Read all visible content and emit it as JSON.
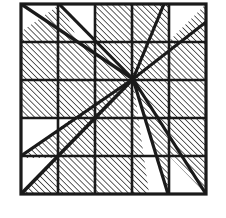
{
  "figure": {
    "type": "geometric-diagram",
    "canvas": {
      "width": 226,
      "height": 218,
      "background": "#ffffff"
    },
    "colors": {
      "ink": "#1a1a1a",
      "hatch": "#2b2b2b",
      "fill_white": "#ffffff",
      "paper": "#ffffff"
    },
    "square": {
      "x": 21,
      "y": 4,
      "width": 185,
      "height": 190,
      "border_width": 3.2,
      "label": "outer-square"
    },
    "grid": {
      "rows": 5,
      "cols": 5,
      "line_width": 2.6,
      "x_lines": [
        58,
        95,
        132,
        169
      ],
      "y_lines": [
        42,
        80,
        118,
        156
      ],
      "label": "5x5-grid"
    },
    "hatching": {
      "angle_degrees": 45,
      "direction": "bottom-left-to-top-right",
      "spacing": 4.2,
      "stroke_width": 1.5,
      "label": "diagonal-hatch-fill"
    },
    "center_point": {
      "x": 133,
      "y": 79,
      "label": "convergence-point"
    },
    "rays": [
      {
        "name": "ray-up-right-to-top-edge",
        "x1": 133,
        "y1": 79,
        "x2": 164,
        "y2": 4,
        "width": 3.2
      },
      {
        "name": "ray-up-left-to-top-left-corner",
        "x1": 133,
        "y1": 79,
        "x2": 22,
        "y2": 5,
        "width": 3.4
      },
      {
        "name": "ray-up-left-secondary",
        "x1": 133,
        "y1": 79,
        "x2": 58,
        "y2": 5,
        "width": 3.2
      },
      {
        "name": "ray-down-left-main-diagonal",
        "x1": 133,
        "y1": 79,
        "x2": 22,
        "y2": 193,
        "width": 3.6
      },
      {
        "name": "ray-down-left-secondary",
        "x1": 133,
        "y1": 79,
        "x2": 22,
        "y2": 156,
        "width": 3.2
      },
      {
        "name": "ray-down-right-steep",
        "x1": 133,
        "y1": 79,
        "x2": 168,
        "y2": 193,
        "width": 3.2
      },
      {
        "name": "ray-down-right-shallow",
        "x1": 133,
        "y1": 79,
        "x2": 205,
        "y2": 193,
        "width": 3.2
      },
      {
        "name": "ray-up-right-to-corner",
        "x1": 133,
        "y1": 79,
        "x2": 205,
        "y2": 23,
        "width": 3.0
      }
    ],
    "white_regions": [
      {
        "name": "white-wedge-top-left",
        "points": "22,5 58,5 22,30",
        "note": "triangle at top-left corner above diagonal"
      },
      {
        "name": "white-wedge-top-second",
        "points": "60,5 95,5 95,42 80,42",
        "note": "wedge between two upper-left rays"
      },
      {
        "name": "white-triangle-top-right",
        "points": "169,5 205,5 205,41 169,41",
        "note": "top-right cell triangle above corner ray"
      },
      {
        "name": "white-triangle-mid-left",
        "points": "22,120 70,120 22,156",
        "note": "triangle left of lower diagonal"
      },
      {
        "name": "white-triangle-bottom-left",
        "points": "22,158 22,193 57,158",
        "note": "bottom-left corner triangle"
      },
      {
        "name": "white-wedge-bottom-right-inner",
        "points": "133,79 168,193 150,193",
        "note": "narrow wedge between two descending rays"
      },
      {
        "name": "white-triangle-bottom-right",
        "points": "169,157 205,193 169,193",
        "note": "bottom-right cell triangle"
      }
    ]
  }
}
